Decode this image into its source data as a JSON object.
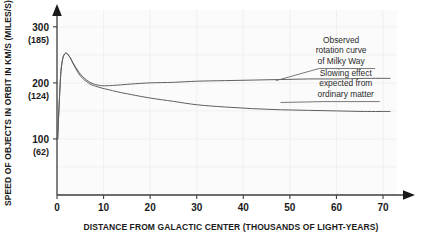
{
  "chart_data": {
    "type": "line",
    "title": "",
    "xlabel": "DISTANCE FROM GALACTIC CENTER (THOUSANDS OF LIGHT-YEARS)",
    "ylabel": "SPEED OF OBJECTS IN ORBIT IN KM/S (MILES/S)",
    "xlim": [
      0,
      73
    ],
    "ylim": [
      0,
      330
    ],
    "xticks": [
      0,
      10,
      20,
      30,
      40,
      50,
      60,
      70
    ],
    "xtick_labels": [
      "0",
      "10",
      "20",
      "30",
      "40",
      "50",
      "60",
      "70"
    ],
    "yticks": [
      100,
      200,
      300
    ],
    "ytick_labels": [
      "100",
      "200",
      "300"
    ],
    "ytick_sublabels": [
      "(62)",
      "(124)",
      "(185)"
    ],
    "grid": true,
    "legend": "none",
    "series": [
      {
        "name": "Observed rotation curve of Milky Way",
        "x": [
          0.15,
          0.4,
          0.8,
          1.2,
          1.6,
          2.0,
          2.4,
          2.9,
          3.4,
          4.0,
          4.7,
          5.5,
          6.4,
          7.3,
          8.3,
          9.5,
          11.0,
          13.0,
          16.0,
          20.0,
          25.0,
          30.0,
          36.0,
          42.0,
          48.0,
          54.0,
          60.0,
          66.0,
          71.5
        ],
        "y": [
          100,
          150,
          215,
          242,
          251,
          253,
          250,
          244,
          236,
          228,
          219,
          211,
          205,
          200,
          197,
          195,
          195,
          196,
          198,
          200,
          201,
          203,
          204,
          205,
          206,
          207,
          207,
          208,
          208
        ]
      },
      {
        "name": "Slowing effect expected from ordinary matter",
        "x": [
          0.15,
          0.4,
          0.8,
          1.2,
          1.6,
          2.0,
          2.4,
          2.9,
          3.4,
          4.0,
          4.7,
          5.5,
          6.4,
          7.3,
          8.3,
          9.5,
          11.0,
          13.0,
          16.0,
          20.0,
          25.0,
          30.0,
          36.0,
          42.0,
          48.0,
          54.0,
          60.0,
          66.0,
          71.5
        ],
        "y": [
          100,
          150,
          215,
          242,
          251,
          253,
          250,
          244,
          235,
          226,
          216,
          208,
          202,
          197,
          194,
          191,
          188,
          184,
          179,
          173,
          167,
          161,
          157,
          154,
          152,
          151,
          150,
          149,
          149
        ]
      }
    ],
    "annotations": [
      {
        "text_lines": [
          "Observed",
          "rotation curve",
          "of Milky Way"
        ],
        "anchor_x": 47,
        "anchor_y": 204,
        "label_x": 61,
        "label_y": 272
      },
      {
        "text_lines": [
          "Slowing effect",
          "expected from",
          "ordinary matter"
        ],
        "anchor_x": 48,
        "anchor_y": 165,
        "label_x": 62,
        "label_y": 213
      }
    ],
    "colors": {
      "curve": "#5f5f5f",
      "axis": "#3d3d3d",
      "grid": "#f0f0f0",
      "plot_background": "#fbfbfb",
      "text": "#1a1a1a",
      "annotation_text": "#2b2b2b"
    }
  }
}
